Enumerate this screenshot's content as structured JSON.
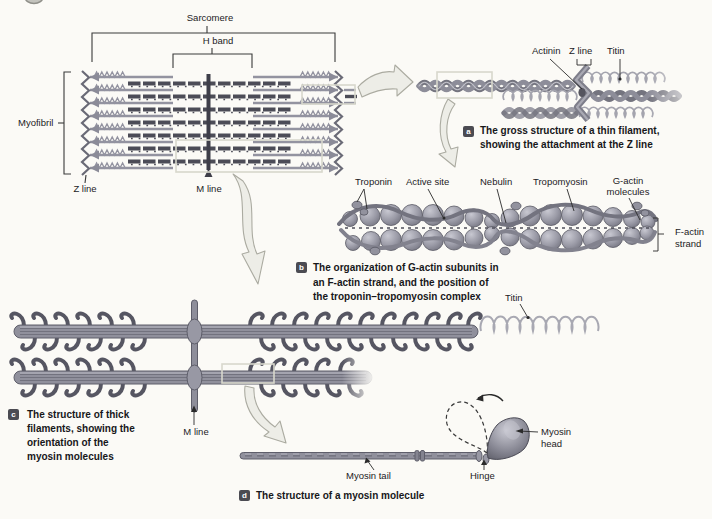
{
  "figure": {
    "type": "anatomy-diagram"
  },
  "colors": {
    "paper": "#fbfaf6",
    "dark_filament": "#4c4c57",
    "mid_gray": "#90909c",
    "light_coil": "#a8a8b2",
    "badge_bg": "#4b4b52",
    "arrow_fill": "#edede7"
  },
  "myofibril": {
    "sarcomere_label": "Sarcomere",
    "h_band_label": "H band",
    "myofibril_label": "Myofibril",
    "z_line_label": "Z line",
    "m_line_label": "M line"
  },
  "panel_a": {
    "badge": "a",
    "labels": {
      "actinin": "Actinin",
      "z_line": "Z line",
      "titin": "Titin"
    },
    "caption": [
      "The gross structure of a thin filament,",
      "showing the attachment at the Z line"
    ]
  },
  "panel_b": {
    "badge": "b",
    "labels": {
      "troponin": "Troponin",
      "active_site": "Active site",
      "nebulin": "Nebulin",
      "tropomyosin": "Tropomyosin",
      "g_actin_1": "G-actin",
      "g_actin_2": "molecules",
      "f_actin_1": "F-actin",
      "f_actin_2": "strand"
    },
    "caption": [
      "The organization of G-actin subunits in",
      "an F-actin strand, and the position of",
      "the troponin–tropomyosin complex"
    ]
  },
  "panel_c": {
    "badge": "c",
    "labels": {
      "titin": "Titin",
      "m_line": "M line"
    },
    "caption": [
      "The structure of thick",
      "filaments, showing the",
      "orientation of the",
      "myosin molecules"
    ]
  },
  "panel_d": {
    "badge": "d",
    "labels": {
      "myosin_head_1": "Myosin",
      "myosin_head_2": "head",
      "myosin_tail": "Myosin tail",
      "hinge": "Hinge"
    },
    "caption": "The structure of a myosin molecule"
  }
}
